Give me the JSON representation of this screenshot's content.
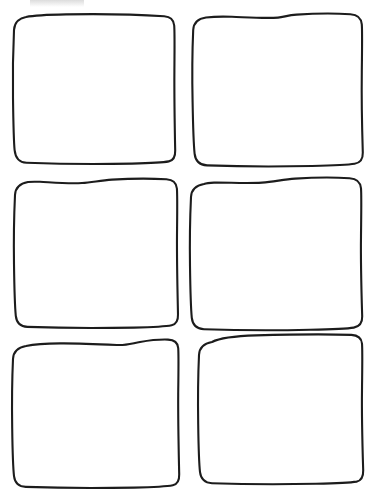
{
  "document": {
    "title": "Blank Comic Panel Template",
    "caption": "Six empty hand-drawn rounded rectangle panels arranged in a 2 column by 3 row grid",
    "background_color": "#ffffff",
    "ink_color": "#1c1c1c",
    "stroke_width_px": 2,
    "canvas": {
      "width": 375,
      "height": 495
    },
    "grid": {
      "columns": 2,
      "rows": 3,
      "panel_count": 6
    }
  },
  "panels": [
    {
      "id": "panel-1",
      "label": "Panel 1",
      "row": 1,
      "column": 1,
      "content": "",
      "bounds": {
        "x": 12,
        "y": 14,
        "width": 163,
        "height": 150
      },
      "corner_radius_px": 14,
      "outline": "M 26 17 C 20 18 14.5 22 14 30 C 13.2 47 12.6 72 13 98 C 13.3 120 13.6 140 14.6 150 C 15.4 158 19 162.5 26.5 162.8 C 54 163.8 96 164.4 132 163.6 C 150 163.2 163 162.6 168.8 161.4 C 173.6 160.4 175.4 156.6 175.2 150.5 C 174.8 131 174.2 101 174.4 71 C 174.5 51 174.8 33 174.2 25.5 C 173.7 19.4 170.6 16.6 164.2 16.2 C 140 14.7 100 13.8 66 14.4 C 48 14.7 33 15.6 26 17 Z"
    },
    {
      "id": "panel-2",
      "label": "Panel 2",
      "row": 1,
      "column": 2,
      "content": "",
      "bounds": {
        "x": 192,
        "y": 12,
        "width": 172,
        "height": 154
      },
      "corner_radius_px": 14,
      "outline": "M 206 17.5 C 198.5 18.6 193.6 22.6 193.2 30 C 192.4 48 192 74 192.6 102 C 193 124 193.6 144 194.6 153.6 C 195.4 161 199.4 165 207 165.4 C 234 166.4 276 166.8 312 166 C 332 165.6 348 165 354.6 163.8 C 360.4 162.8 363 159 362.8 152.6 C 362.2 133 361.4 102 361.8 72 C 362 52 362.4 32 361.8 24.4 C 361.2 17.6 357.6 14.6 350.4 14.2 C 334 13.2 312 13.6 296.6 14.6 C 288 15.2 284 17 278 17.6 C 266 18.6 248 17.4 232 16.8 C 221 16.4 212 16.8 206 17.5 Z"
    },
    {
      "id": "panel-3",
      "label": "Panel 3",
      "row": 2,
      "column": 1,
      "content": "",
      "bounds": {
        "x": 12,
        "y": 176,
        "width": 165,
        "height": 150
      },
      "corner_radius_px": 14,
      "outline": "M 28 182 C 20.5 183.4 15.4 187.4 15 195 C 14.2 212 13.6 238 14 264 C 14.3 286 14.8 306 15.8 315.8 C 16.6 323 20.4 326.6 27.4 326.9 C 54 327.9 96 328.4 134 327.6 C 152 327.2 166 326.5 171.6 325.3 C 176.4 324.3 178.2 320.6 178 314.4 C 177.6 295 176.8 265 177 235 C 177.2 215 177.5 196 176.9 188.5 C 176.4 182.4 173 179.6 166.4 179.2 C 148 178.2 128 178.6 112 179.6 C 100 180.4 92 182.4 82 183 C 68 183.8 52 182.4 40 181.8 C 35 181.6 31 181.6 28 182 Z"
    },
    {
      "id": "panel-4",
      "label": "Panel 4",
      "row": 2,
      "column": 2,
      "content": "",
      "bounds": {
        "x": 190,
        "y": 175,
        "width": 174,
        "height": 153
      },
      "corner_radius_px": 14,
      "outline": "M 204 184 C 196 185.4 191.4 189.4 191 197 C 190.2 214 189.6 240 190 266 C 190.3 288 190.8 308 191.8 317.8 C 192.6 325 196.6 328.8 204 329.2 C 231 330.2 274 330.6 310 329.8 C 330 329.4 347 328.8 353.8 327.6 C 359.6 326.6 362.4 322.8 362.2 316.4 C 361.6 297 360.6 266 361 236 C 361.2 216 361.6 196 361 188.4 C 360.4 181.6 356.8 178.6 349.6 178.2 C 333 177.2 311 177.6 295 178.6 C 283 179.4 274 181.8 262 182.6 C 246 183.6 228 182.4 214 182.6 C 209 182.7 206 183.2 204 184 Z"
    },
    {
      "id": "panel-5",
      "label": "Panel 5",
      "row": 3,
      "column": 1,
      "content": "",
      "bounds": {
        "x": 11,
        "y": 339,
        "width": 168,
        "height": 146
      },
      "corner_radius_px": 14,
      "outline": "M 26 346 C 18 347.4 13.4 351.4 13 359 C 12.2 376 11.8 402 12.2 428 C 12.5 450 13 467 14 476 C 14.8 483 18.6 486.6 25.8 486.9 C 53 487.9 96 488.4 134 487.6 C 153 487.2 167 486.5 172.8 485.3 C 177.6 484.3 179.4 480.6 179.2 474.4 C 178.8 455 178 424 178.2 394 C 178.4 374 178.8 355 178.2 348 C 177.7 342.2 174.4 339.8 168 339.6 C 157 339.2 148 340.6 140 342 C 132 343.4 126 345.4 118 345 C 100 344.2 78 343.2 60 343.4 C 44 343.6 32 344.8 26 346 Z"
    },
    {
      "id": "panel-6",
      "label": "Panel 6",
      "row": 3,
      "column": 2,
      "content": "",
      "bounds": {
        "x": 196,
        "y": 336,
        "width": 168,
        "height": 146
      },
      "corner_radius_px": 14,
      "outline": "M 212 342 C 204 343.4 199.4 347.6 199 355 C 198.2 372 197.8 398 198.2 424 C 198.5 446 199 463 200 472 C 200.8 479 204.6 482.8 212 483.2 C 239 484.2 280 484.6 316 483.8 C 335 483.4 350 482.8 356.6 481.6 C 361.4 480.6 363.4 476.8 363.2 470.4 C 362.6 451 361.6 420 362 390 C 362.2 370 362.6 351 362 343.6 C 361.4 337.6 358 335.2 351.4 334.9 C 328 334 290 334.4 256 335.4 C 236 336 220 337.8 212 342 Z"
    }
  ],
  "artifacts": [
    {
      "id": "scan-smudge-top-left",
      "label": "faint scanner smudge",
      "visible": true
    }
  ]
}
